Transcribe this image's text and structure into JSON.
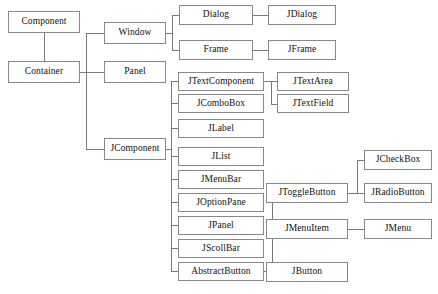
{
  "diagram": {
    "type": "tree-diagram",
    "style": {
      "background": "#ffffff",
      "box_fill": "#ffffff",
      "box_border": "#888888",
      "edge_color": "#7a7a7a",
      "text_color": "#111111"
    },
    "nodes": [
      {
        "id": "component",
        "label": "Component",
        "x": 8,
        "y": 11,
        "w": 72,
        "h": 22
      },
      {
        "id": "container",
        "label": "Container",
        "x": 8,
        "y": 61,
        "w": 72,
        "h": 22
      },
      {
        "id": "window",
        "label": "Window",
        "x": 104,
        "y": 22,
        "w": 62,
        "h": 22
      },
      {
        "id": "panel",
        "label": "Panel",
        "x": 104,
        "y": 61,
        "w": 62,
        "h": 22
      },
      {
        "id": "jcomponent",
        "label": "JComponent",
        "x": 104,
        "y": 138,
        "w": 62,
        "h": 22
      },
      {
        "id": "dialog",
        "label": "Dialog",
        "x": 179,
        "y": 5,
        "w": 74,
        "h": 20
      },
      {
        "id": "frame",
        "label": "Frame",
        "x": 179,
        "y": 40,
        "w": 74,
        "h": 20
      },
      {
        "id": "jdialog",
        "label": "JDialog",
        "x": 268,
        "y": 5,
        "w": 68,
        "h": 20
      },
      {
        "id": "jframe",
        "label": "JFrame",
        "x": 268,
        "y": 40,
        "w": 68,
        "h": 20
      },
      {
        "id": "jtextcomponent",
        "label": "JTextComponent",
        "x": 178,
        "y": 72,
        "w": 86,
        "h": 19
      },
      {
        "id": "jcombobox",
        "label": "JComboBox",
        "x": 178,
        "y": 94,
        "w": 86,
        "h": 19
      },
      {
        "id": "jlabel",
        "label": "JLabel",
        "x": 178,
        "y": 119,
        "w": 86,
        "h": 19
      },
      {
        "id": "jlist",
        "label": "JList",
        "x": 178,
        "y": 147,
        "w": 86,
        "h": 19
      },
      {
        "id": "jmenubar",
        "label": "JMenuBar",
        "x": 178,
        "y": 170,
        "w": 86,
        "h": 19
      },
      {
        "id": "joptionpane",
        "label": "JOptionPane",
        "x": 178,
        "y": 193,
        "w": 86,
        "h": 19
      },
      {
        "id": "jpanel",
        "label": "JPanel",
        "x": 178,
        "y": 216,
        "w": 86,
        "h": 19
      },
      {
        "id": "jscollbar",
        "label": "JScollBar",
        "x": 178,
        "y": 239,
        "w": 86,
        "h": 19
      },
      {
        "id": "abstractbutton",
        "label": "AbstractButton",
        "x": 178,
        "y": 262,
        "w": 86,
        "h": 19
      },
      {
        "id": "jtextarea",
        "label": "JTextArea",
        "x": 277,
        "y": 72,
        "w": 72,
        "h": 19
      },
      {
        "id": "jtextfield",
        "label": "JTextField",
        "x": 277,
        "y": 94,
        "w": 72,
        "h": 19
      },
      {
        "id": "jtogglebutton",
        "label": "JToggleButton",
        "x": 266,
        "y": 183,
        "w": 82,
        "h": 20
      },
      {
        "id": "jcheckbox",
        "label": "JCheckBox",
        "x": 364,
        "y": 150,
        "w": 68,
        "h": 20
      },
      {
        "id": "jradiobutton",
        "label": "JRadioButton",
        "x": 364,
        "y": 183,
        "w": 68,
        "h": 20
      },
      {
        "id": "jmenuitem",
        "label": "JMenuItem",
        "x": 266,
        "y": 219,
        "w": 82,
        "h": 20
      },
      {
        "id": "jmenu",
        "label": "JMenu",
        "x": 364,
        "y": 219,
        "w": 68,
        "h": 20
      },
      {
        "id": "jbutton",
        "label": "JButton",
        "x": 266,
        "y": 262,
        "w": 82,
        "h": 20
      }
    ],
    "edges": [
      {
        "id": "component-container",
        "orient": "v",
        "x": 44,
        "y": 33,
        "len": 28
      },
      {
        "id": "container-trunk-h",
        "orient": "h",
        "x": 80,
        "y": 72,
        "len": 24
      },
      {
        "id": "container-trunk-v",
        "orient": "v",
        "x": 86,
        "y": 33,
        "len": 116
      },
      {
        "id": "to-window",
        "orient": "h",
        "x": 86,
        "y": 33,
        "len": 18
      },
      {
        "id": "to-panel",
        "orient": "h",
        "x": 86,
        "y": 72,
        "len": 18
      },
      {
        "id": "to-jcomponent",
        "orient": "h",
        "x": 86,
        "y": 149,
        "len": 18
      },
      {
        "id": "window-out",
        "orient": "h",
        "x": 166,
        "y": 33,
        "len": 7
      },
      {
        "id": "window-trunk",
        "orient": "v",
        "x": 172,
        "y": 15,
        "len": 35
      },
      {
        "id": "to-dialog",
        "orient": "h",
        "x": 172,
        "y": 15,
        "len": 7
      },
      {
        "id": "to-frame",
        "orient": "h",
        "x": 172,
        "y": 50,
        "len": 7
      },
      {
        "id": "dialog-jdialog",
        "orient": "h",
        "x": 253,
        "y": 15,
        "len": 15
      },
      {
        "id": "frame-jframe",
        "orient": "h",
        "x": 253,
        "y": 50,
        "len": 15
      },
      {
        "id": "jcomp-out",
        "orient": "h",
        "x": 166,
        "y": 149,
        "len": 6
      },
      {
        "id": "jcomp-trunk",
        "orient": "v",
        "x": 171,
        "y": 81,
        "len": 191
      },
      {
        "id": "stub-jtextcomponent",
        "orient": "h",
        "x": 171,
        "y": 81,
        "len": 7
      },
      {
        "id": "stub-jcombobox",
        "orient": "h",
        "x": 171,
        "y": 103,
        "len": 7
      },
      {
        "id": "stub-jlabel",
        "orient": "h",
        "x": 171,
        "y": 128,
        "len": 7
      },
      {
        "id": "stub-jlist",
        "orient": "h",
        "x": 171,
        "y": 156,
        "len": 7
      },
      {
        "id": "stub-jmenubar",
        "orient": "h",
        "x": 171,
        "y": 179,
        "len": 7
      },
      {
        "id": "stub-joptionpane",
        "orient": "h",
        "x": 171,
        "y": 202,
        "len": 7
      },
      {
        "id": "stub-jpanel",
        "orient": "h",
        "x": 171,
        "y": 225,
        "len": 7
      },
      {
        "id": "stub-jscollbar",
        "orient": "h",
        "x": 171,
        "y": 248,
        "len": 7
      },
      {
        "id": "stub-abstractbutton",
        "orient": "h",
        "x": 171,
        "y": 271,
        "len": 7
      },
      {
        "id": "jtext-out",
        "orient": "h",
        "x": 264,
        "y": 81,
        "len": 8
      },
      {
        "id": "jtext-trunk",
        "orient": "v",
        "x": 271,
        "y": 81,
        "len": 23
      },
      {
        "id": "to-jtextarea",
        "orient": "h",
        "x": 271,
        "y": 81,
        "len": 6
      },
      {
        "id": "to-jtextfield",
        "orient": "h",
        "x": 271,
        "y": 104,
        "len": 6
      },
      {
        "id": "ab-out",
        "orient": "h",
        "x": 264,
        "y": 271,
        "len": 9
      },
      {
        "id": "ab-trunk",
        "orient": "v",
        "x": 272,
        "y": 193,
        "len": 79
      },
      {
        "id": "to-jtogglebutton",
        "orient": "h",
        "x": 272,
        "y": 193,
        "len": 6
      },
      {
        "id": "to-jmenuitem",
        "orient": "h",
        "x": 272,
        "y": 229,
        "len": 6
      },
      {
        "id": "to-jbutton",
        "orient": "h",
        "x": 272,
        "y": 271,
        "len": 6
      },
      {
        "id": "jtoggle-out",
        "orient": "h",
        "x": 348,
        "y": 193,
        "len": 10
      },
      {
        "id": "jtoggle-trunk",
        "orient": "v",
        "x": 357,
        "y": 160,
        "len": 34
      },
      {
        "id": "to-jcheckbox",
        "orient": "h",
        "x": 357,
        "y": 160,
        "len": 8
      },
      {
        "id": "to-jradiobutton",
        "orient": "h",
        "x": 357,
        "y": 193,
        "len": 8
      },
      {
        "id": "jmenuitem-jmenu",
        "orient": "h",
        "x": 348,
        "y": 229,
        "len": 17
      }
    ]
  }
}
